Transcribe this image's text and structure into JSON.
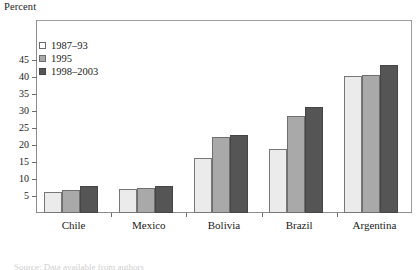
{
  "chart_data": {
    "type": "bar",
    "title": "",
    "ylabel": "Percent",
    "xlabel": "",
    "categories": [
      "Chile",
      "Mexico",
      "Bolivia",
      "Brazil",
      "Argentina"
    ],
    "series": [
      {
        "name": "1987–93",
        "values": [
          6.2,
          7.1,
          16.2,
          18.8,
          40.3
        ],
        "color": "#ebebeb"
      },
      {
        "name": "1995",
        "values": [
          6.9,
          7.3,
          22.5,
          28.4,
          40.6
        ],
        "color": "#a9a9a9"
      },
      {
        "name": "1998–2003",
        "values": [
          7.8,
          7.9,
          23.0,
          31.2,
          43.4
        ],
        "color": "#555555"
      }
    ],
    "ylim": [
      0,
      48
    ],
    "yticks": [
      5,
      10,
      15,
      20,
      25,
      30,
      35,
      40,
      45
    ],
    "ytick_labels": [
      "5",
      "10",
      "15",
      "20",
      "25",
      "30",
      "35",
      "40",
      "45"
    ],
    "grid": false,
    "legend_position": "top-left",
    "frame": true
  },
  "legend": {
    "entries": [
      "1987–93",
      "1995",
      "1998–2003"
    ]
  },
  "notes": {
    "source_clipped": "Source: Data available from authors"
  }
}
